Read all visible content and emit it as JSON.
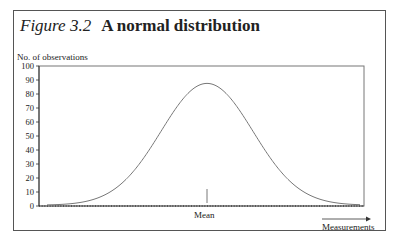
{
  "figure": {
    "number": "Figure 3.2",
    "title": "A normal distribution"
  },
  "axes": {
    "ylabel": "No. of observations",
    "xlabel": "Measurements",
    "mean_label": "Mean"
  },
  "colors": {
    "frame": "#555555",
    "curve": "#777777",
    "axis": "#333333",
    "text": "#222222"
  },
  "chart_data": {
    "type": "line",
    "xlabel": "Measurements",
    "ylabel": "No. of observations",
    "ylim": [
      0,
      100
    ],
    "yticks": [
      0,
      10,
      20,
      30,
      40,
      50,
      60,
      70,
      80,
      90,
      100
    ],
    "xticks": [],
    "grid": false,
    "legend": null,
    "annotations": [
      {
        "text": "Mean",
        "x": "mean",
        "marker": "vertical tick at mean on x-axis"
      },
      {
        "text": "Measurements",
        "marker": "arrow pointing right beneath x-axis"
      }
    ],
    "series": [
      {
        "name": "Normal distribution curve",
        "shape": "bell curve (Gaussian)",
        "peak_value": 87,
        "peak_position": "mean (center)",
        "x_relative": [
          0.0,
          0.1,
          0.2,
          0.3,
          0.4,
          0.5,
          0.6,
          0.7,
          0.8,
          0.9,
          1.0
        ],
        "values": [
          0.5,
          2,
          8,
          27,
          61,
          87,
          61,
          27,
          8,
          2,
          0.5
        ]
      }
    ]
  }
}
